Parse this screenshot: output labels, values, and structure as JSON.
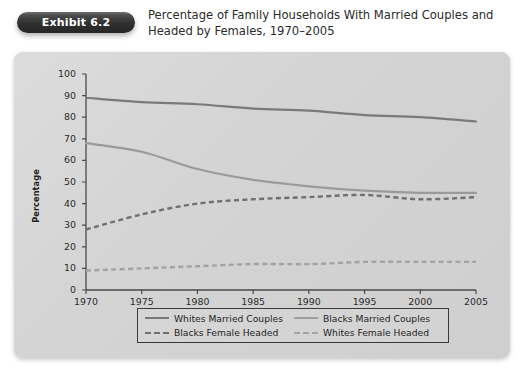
{
  "header": {
    "badge_label": "Exhibit 6.2",
    "title_line1": "Percentage of Family Households With Married Couples and",
    "title_line2": "Headed by Females, 1970–2005"
  },
  "colors": {
    "badge_background": "#2f2f2f",
    "panel_background": "#d7d7d7",
    "whites_married": "#7a7a7a",
    "blacks_married": "#9a9a9a",
    "blacks_female": "#6f6f6f",
    "whites_female": "#a2a2a2",
    "axis": "#4a4a4a",
    "text": "#2a2a2a"
  },
  "chart_data": {
    "type": "line",
    "title": "Percentage of Family Households With Married Couples and Headed by Females, 1970–2005",
    "xlabel": "",
    "ylabel": "Percentage",
    "xlim": [
      1970,
      2005
    ],
    "ylim": [
      0,
      100
    ],
    "grid": false,
    "legend_position": "bottom",
    "x": [
      1970,
      1975,
      1980,
      1985,
      1990,
      1995,
      2000,
      2005
    ],
    "xticks": [
      "1970",
      "1975",
      "1980",
      "1985",
      "1990",
      "1995",
      "2000",
      "2005"
    ],
    "yticks": [
      "0",
      "10",
      "20",
      "30",
      "40",
      "50",
      "60",
      "70",
      "80",
      "90",
      "100"
    ],
    "series": [
      {
        "name": "Whites Married Couples",
        "style": "solid",
        "color": "#7a7a7a",
        "values": [
          89,
          87,
          86,
          84,
          83,
          81,
          80,
          78
        ]
      },
      {
        "name": "Blacks Married Couples",
        "style": "solid",
        "color": "#9a9a9a",
        "values": [
          68,
          64,
          56,
          51,
          48,
          46,
          45,
          45
        ]
      },
      {
        "name": "Blacks Female Headed",
        "style": "dashed",
        "color": "#6f6f6f",
        "values": [
          28,
          35,
          40,
          42,
          43,
          44,
          42,
          43
        ]
      },
      {
        "name": "Whites Female Headed",
        "style": "dashed",
        "color": "#a2a2a2",
        "values": [
          9,
          10,
          11,
          12,
          12,
          13,
          13,
          13
        ]
      }
    ]
  },
  "legend": {
    "items": [
      {
        "label": "Whites Married Couples",
        "swatch": "sw-solid-dark"
      },
      {
        "label": "Blacks Married Couples",
        "swatch": "sw-solid-light"
      },
      {
        "label": "Blacks Female Headed",
        "swatch": "sw-dash-dark"
      },
      {
        "label": "Whites Female Headed",
        "swatch": "sw-dash-light"
      }
    ]
  }
}
